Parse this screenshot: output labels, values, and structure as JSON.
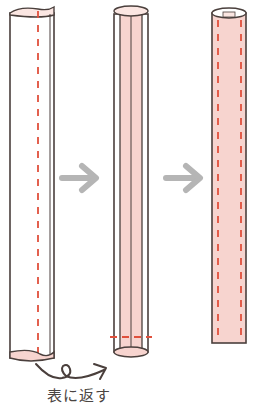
{
  "diagram": {
    "type": "sewing-instruction",
    "steps": [
      {
        "id": "step-1",
        "description": "flat folded fabric strip, inside out, with stitch line"
      },
      {
        "id": "step-2",
        "description": "tube with inner layer shown, stitched across bottom"
      },
      {
        "id": "step-3",
        "description": "finished tube turned right side out with stitch lines on both edges"
      }
    ],
    "caption": "表に返す",
    "colors": {
      "outline": "#4a3f3c",
      "fabric_fill": "#f7d4cf",
      "fabric_light": "#fbe6e2",
      "stitch": "#e0503c",
      "arrow": "#b5b5b5",
      "text": "#4a4542"
    }
  }
}
